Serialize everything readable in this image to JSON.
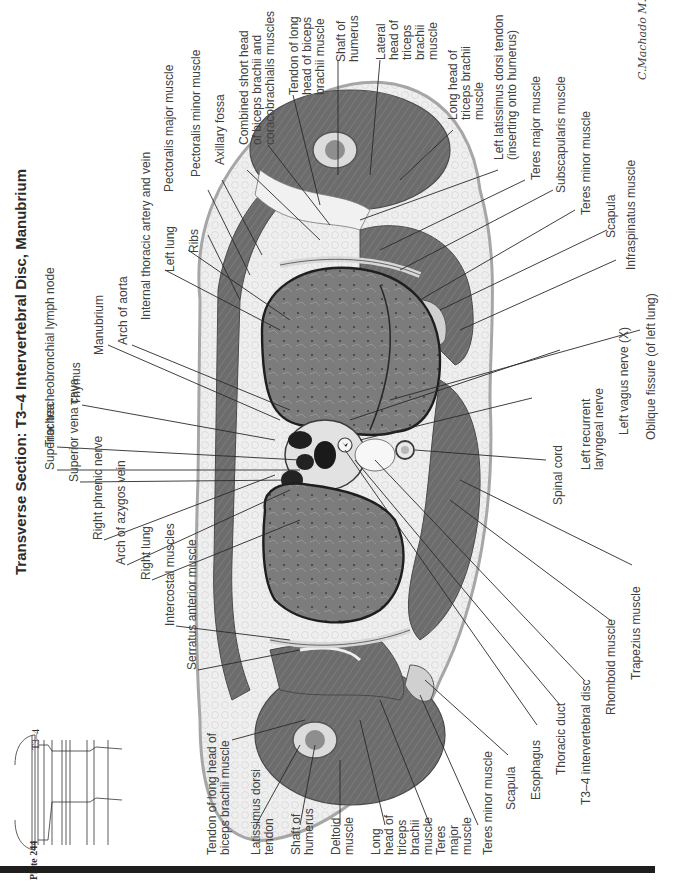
{
  "page": {
    "title": "Transverse Section: T3–4 Intervertebral Disc, Manubrium",
    "plate": "Plate 244",
    "level_label": "T3–4",
    "signature": "C.Machado M.D.",
    "orientation": "rotated 90° counter-clockwise"
  },
  "colors": {
    "background": "#ffffff",
    "text": "#404040",
    "leader_line": "#2a2a2a",
    "skin": "#e6e6e6",
    "fat": "#f0f0f0",
    "muscle": "#6e6e6e",
    "muscle_dark": "#5a5a5a",
    "lung": "#7a7a7a",
    "bone": "#d8d8d8",
    "vessel_dark": "#1c1c1c",
    "bar": "#1e1e1e"
  },
  "labels": {
    "left_column": [
      "Superior tracheobronchial lymph node",
      "Superior vena cava",
      "Right phrenic nerve",
      "Arch of azygos vein",
      "Right lung",
      "Intercostal muscles",
      "Serratus anterior muscle",
      "Tendon of long head of\nbiceps brachii muscle",
      "Latissimus dorsi\ntendon",
      "Shaft of\nhumerus",
      "Deltoid\nmuscle",
      "Long\nhead of\ntriceps\nbrachii\nmuscle",
      "Teres\nmajor\nmuscle",
      "Teres minor muscle",
      "Scapula",
      "Esophagus",
      "Thoracic duct",
      "T3–4 intervertebral disc",
      "Rhomboid muscle",
      "Trapezius muscle"
    ],
    "top_column": [
      "Trachea",
      "Thymus",
      "Manubrium",
      "Arch of aorta",
      "Internal thoracic artery and vein",
      "Left lung",
      "Ribs",
      "Pectoralis major muscle",
      "Pectoralis minor muscle",
      "Axillary fossa",
      "Combined short head\nof biceps brachii and\ncoracobrachialis muscles",
      "Tendon of long\nhead of biceps\nbrachii muscle",
      "Shaft of\nhumerus",
      "Lateral\nhead of\ntriceps\nbrachii\nmuscle",
      "Long head of\ntriceps brachii\nmuscle",
      "Left latissimus dorsi tendon\n(inserting onto humerus)",
      "Teres major muscle",
      "Subscapularis muscle",
      "Teres minor muscle",
      "Scapula",
      "Infraspinatus muscle",
      "Oblique fissure (of left lung)",
      "Left vagus nerve (X)",
      "Left recurrent\nlaryngeal nerve",
      "Spinal cord"
    ]
  }
}
